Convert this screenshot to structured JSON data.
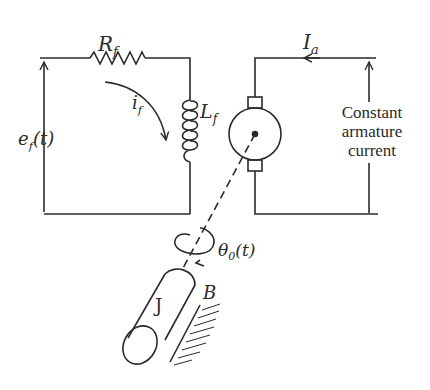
{
  "labels": {
    "resistor": {
      "main": "R",
      "sub": "f"
    },
    "inductor": {
      "main": "L",
      "sub": "f"
    },
    "field_current": {
      "main": "i",
      "sub": "f"
    },
    "field_voltage": {
      "main": "e",
      "sub": "f",
      "arg": "(t)"
    },
    "armature_current": {
      "main": "I",
      "sub": "a"
    },
    "armature_note": [
      "Constant",
      "armature",
      "current"
    ],
    "angle": {
      "main": "θ",
      "sub": "0",
      "arg": "(t)"
    },
    "inertia": "J",
    "damping": "B"
  },
  "colors": {
    "stroke": "#2a2a2a",
    "background": "#ffffff"
  }
}
